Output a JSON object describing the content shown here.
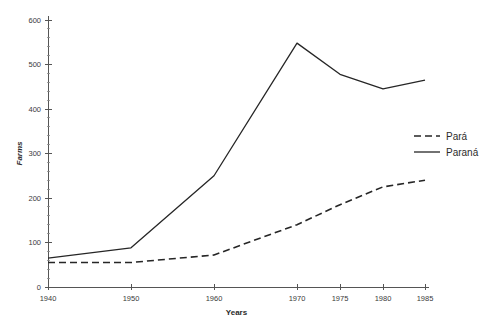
{
  "chart_data": {
    "type": "line",
    "title": "",
    "xlabel": "Years",
    "ylabel": "Farms",
    "x": [
      1940,
      1950,
      1960,
      1970,
      1975,
      1980,
      1985
    ],
    "categories": [
      "1940",
      "1950",
      "1960",
      "1970",
      "1975",
      "1980",
      "1985"
    ],
    "series": [
      {
        "name": "Pará",
        "style": "dashed",
        "color": "#262626",
        "values": [
          55,
          55,
          72,
          140,
          185,
          225,
          240
        ]
      },
      {
        "name": "Paraná",
        "style": "solid",
        "color": "#262626",
        "values": [
          65,
          88,
          250,
          548,
          478,
          445,
          465
        ]
      }
    ],
    "ylim": [
      0,
      600
    ],
    "y_ticks": [
      0,
      100,
      200,
      300,
      400,
      500,
      600
    ],
    "y_tick_labels": [
      "0",
      "100",
      "200",
      "300",
      "400",
      "500",
      "600"
    ],
    "y_minor_step": 20,
    "x_tick_labels": [
      "1940",
      "1950",
      "1960",
      "1970",
      "1975",
      "1980",
      "1985"
    ],
    "grid": false,
    "legend_position": "right-center"
  },
  "legend": {
    "entries": [
      {
        "label": "Pará",
        "style": "dashed"
      },
      {
        "label": "Paraná",
        "style": "solid"
      }
    ]
  },
  "axes": {
    "y_title": "Farms",
    "x_title": "Years"
  }
}
